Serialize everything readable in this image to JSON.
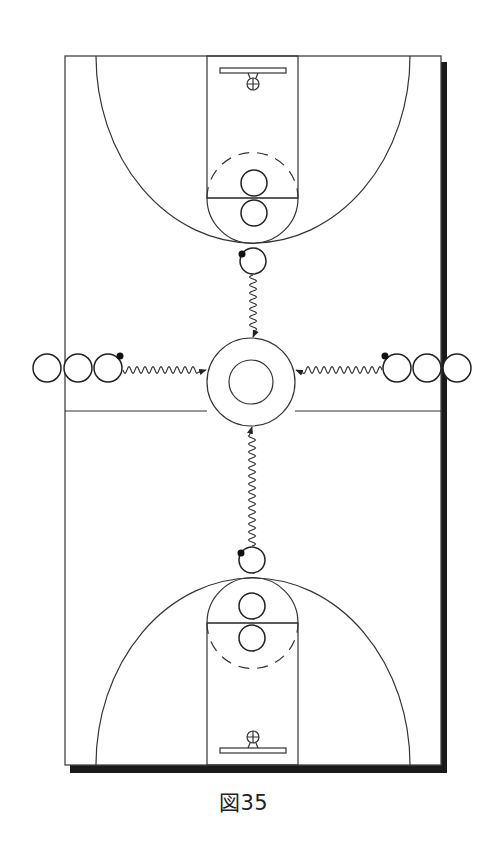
{
  "figure": {
    "caption": "図35"
  },
  "colors": {
    "line": "#333333",
    "shadow": "#1a1a1a",
    "court": "#ffffff",
    "ball": "#111111"
  },
  "players": {
    "left_line_count": 3,
    "right_line_count": 3,
    "top_key_count": 2,
    "bottom_key_count": 2,
    "dribblers": [
      "top",
      "bottom",
      "left",
      "right"
    ]
  },
  "movements": [
    {
      "from": "top-dribbler",
      "to": "center-circle",
      "type": "dribble"
    },
    {
      "from": "bottom-dribbler",
      "to": "center-circle",
      "type": "dribble"
    },
    {
      "from": "left-dribbler",
      "to": "center-circle",
      "type": "dribble"
    },
    {
      "from": "right-dribbler",
      "to": "center-circle",
      "type": "dribble"
    }
  ]
}
